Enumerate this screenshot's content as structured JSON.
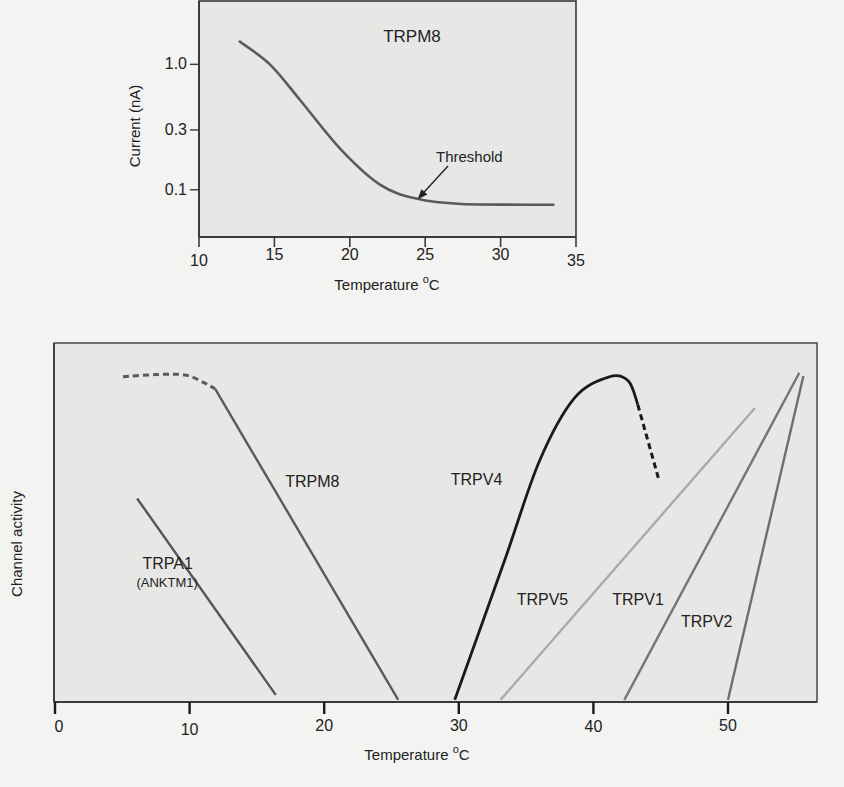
{
  "chart_data": [
    {
      "type": "line",
      "title": "TRPM8",
      "xlabel": "Temperature",
      "xlabel_unit_sup": "o",
      "xlabel_unit": "C",
      "ylabel": "Current (nA)",
      "yscale": "log",
      "xlim": [
        10,
        35
      ],
      "ylim": [
        0.042,
        3.2
      ],
      "xticks": [
        10,
        15,
        20,
        25,
        30,
        35
      ],
      "xtick_labels": [
        "10",
        "15",
        "20",
        "25",
        "30",
        "35"
      ],
      "yticks": [
        1.0,
        0.3,
        0.1
      ],
      "ytick_labels": [
        "1.0",
        "0.3",
        "0.1"
      ],
      "grid": false,
      "series": [
        {
          "name": "TRPM8",
          "color": "#5a5a5a",
          "x": [
            12.7,
            14.7,
            16.7,
            19.4,
            22.0,
            24.4,
            27.4,
            33.5
          ],
          "y": [
            1.52,
            1.0,
            0.52,
            0.21,
            0.11,
            0.085,
            0.077,
            0.076
          ]
        }
      ],
      "annotations": [
        {
          "text": "Threshold",
          "arrow_to": {
            "x": 24.5,
            "y": 0.084
          }
        }
      ]
    },
    {
      "type": "line",
      "title": "",
      "xlabel": "Temperature",
      "xlabel_unit_sup": "o",
      "xlabel_unit": "C",
      "ylabel": "Channel activity",
      "xlim": [
        0,
        56.7
      ],
      "ylim": [
        0,
        1
      ],
      "xticks": [
        0,
        10,
        20,
        30,
        40,
        50
      ],
      "xtick_labels": [
        "0",
        "10",
        "20",
        "30",
        "40",
        "50"
      ],
      "yticks": [],
      "grid": false,
      "series": [
        {
          "name": "TRPA1",
          "sublabel": "(ANKTM1)",
          "color": "#555555",
          "segments": [
            {
              "style": "solid",
              "x": [
                6.1,
                16.4
              ],
              "y": [
                0.567,
                0.02
              ]
            }
          ]
        },
        {
          "name": "TRPM8",
          "color": "#5a5a5a",
          "segments": [
            {
              "style": "dashed",
              "x": [
                5.05,
                7.5,
                9.66,
                11.1,
                11.9
              ],
              "y": [
                0.906,
                0.912,
                0.911,
                0.889,
                0.872
              ]
            },
            {
              "style": "solid",
              "x": [
                11.9,
                25.5
              ],
              "y": [
                0.872,
                0.006
              ]
            }
          ]
        },
        {
          "name": "TRPV4",
          "color": "#1a1a1a",
          "segments": [
            {
              "style": "solid",
              "x": [
                29.7,
                33.4,
                36.0,
                38.6,
                41.2,
                42.6,
                43.3
              ],
              "y": [
                0.006,
                0.394,
                0.672,
                0.847,
                0.906,
                0.894,
                0.828
              ]
            },
            {
              "style": "dashed",
              "x": [
                43.3,
                44.9
              ],
              "y": [
                0.828,
                0.614
              ]
            }
          ]
        },
        {
          "name": "TRPV5",
          "color": "#aaaaaa",
          "segments": [
            {
              "style": "solid",
              "x": [
                33.1,
                52.0
              ],
              "y": [
                0.006,
                0.819
              ]
            }
          ]
        },
        {
          "name": "TRPV1",
          "color": "#767676",
          "segments": [
            {
              "style": "solid",
              "x": [
                42.3,
                55.3
              ],
              "y": [
                0.006,
                0.917
              ]
            }
          ]
        },
        {
          "name": "TRPV2",
          "color": "#6e6e6e",
          "segments": [
            {
              "style": "solid",
              "x": [
                50.0,
                55.6
              ],
              "y": [
                0.006,
                0.908
              ]
            }
          ]
        }
      ],
      "series_label_positions": {
        "TRPA1": {
          "x": 6.5,
          "y": 0.37
        },
        "TRPM8": {
          "x": 17.1,
          "y": 0.6
        },
        "TRPV4": {
          "x": 29.4,
          "y": 0.605
        },
        "TRPV5": {
          "x": 34.3,
          "y": 0.27
        },
        "TRPV1": {
          "x": 41.4,
          "y": 0.27
        },
        "TRPV2": {
          "x": 46.5,
          "y": 0.21
        }
      }
    }
  ],
  "colors": {
    "page_background": "#f3f3f2",
    "plot_background": "#e7e7e6",
    "axis": "#3a3a3a"
  }
}
